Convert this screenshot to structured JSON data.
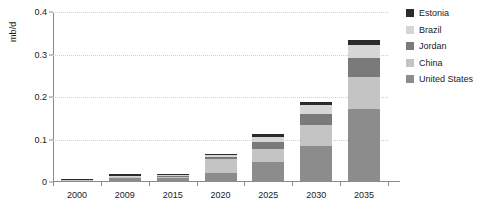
{
  "chart_data": {
    "type": "bar",
    "subtype": "stacked-bar",
    "title": "",
    "xlabel": "",
    "ylabel": "mb/d",
    "categories": [
      "2000",
      "2009",
      "2015",
      "2020",
      "2025",
      "2030",
      "2035"
    ],
    "series": [
      {
        "name": "United States",
        "color": "#8c8c8c",
        "values": [
          0.004,
          0.009,
          0.01,
          0.022,
          0.047,
          0.084,
          0.172
        ]
      },
      {
        "name": "China",
        "color": "#c4c4c4",
        "values": [
          0.001,
          0.003,
          0.004,
          0.032,
          0.03,
          0.05,
          0.075
        ]
      },
      {
        "name": "Jordan",
        "color": "#7a7a7a",
        "values": [
          0.0,
          0.001,
          0.001,
          0.004,
          0.017,
          0.027,
          0.045
        ]
      },
      {
        "name": "Brazil",
        "color": "#d6d6d6",
        "values": [
          0.001,
          0.002,
          0.002,
          0.005,
          0.012,
          0.02,
          0.031
        ]
      },
      {
        "name": "Estonia",
        "color": "#2b2b2b",
        "values": [
          0.001,
          0.003,
          0.003,
          0.004,
          0.007,
          0.008,
          0.01
        ]
      }
    ],
    "totals": [
      0.007,
      0.018,
      0.02,
      0.067,
      0.113,
      0.189,
      0.333
    ],
    "ylim": [
      0,
      0.4
    ],
    "yticks": [
      0,
      0.1,
      0.2,
      0.3,
      0.4
    ],
    "ytick_labels": [
      "0",
      "0.1",
      "0.2",
      "0.3",
      "0.4"
    ],
    "grid": true,
    "legend_position": "right",
    "stack_order_bottom_to_top": [
      "United States",
      "China",
      "Jordan",
      "Brazil",
      "Estonia"
    ]
  },
  "legend": {
    "items": [
      {
        "label": "Estonia",
        "color": "#2b2b2b"
      },
      {
        "label": "Brazil",
        "color": "#d6d6d6"
      },
      {
        "label": "Jordan",
        "color": "#7a7a7a"
      },
      {
        "label": "China",
        "color": "#c4c4c4"
      },
      {
        "label": "United States",
        "color": "#8c8c8c"
      }
    ]
  },
  "axis": {
    "y_label": "mb/d",
    "y_tick_labels": [
      "0.4",
      "0.3",
      "0.2",
      "0.1",
      "0"
    ],
    "x_tick_labels": [
      "2000",
      "2009",
      "2015",
      "2020",
      "2025",
      "2030",
      "2035"
    ]
  },
  "colors": {
    "axis": "#8a8a8a",
    "grid": "#cfcfcf",
    "text": "#1a1a1a",
    "background": "#ffffff"
  }
}
